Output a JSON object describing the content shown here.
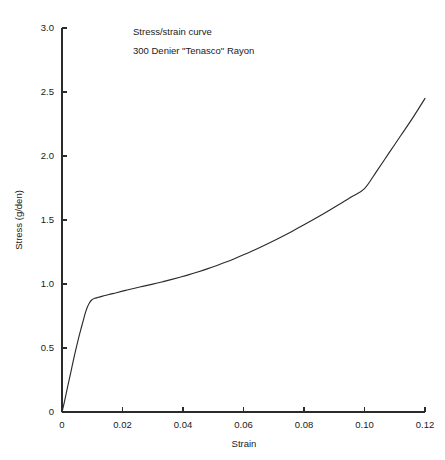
{
  "chart_data": {
    "type": "line",
    "title": "Stress/strain curve",
    "subtitle": "300 Denier \"Tenasco\" Rayon",
    "xlabel": "Strain",
    "ylabel": "Stress (g/den)",
    "xlim": [
      0,
      0.12
    ],
    "ylim": [
      0,
      3.0
    ],
    "grid": false,
    "legend": "none",
    "xticks": [
      0,
      0.02,
      0.04,
      0.06,
      0.08,
      0.1,
      0.12
    ],
    "xtick_labels": [
      "0",
      "0.02",
      "0.04",
      "0.06",
      "0.08",
      "0.10",
      "0.12"
    ],
    "yticks": [
      0,
      0.5,
      1.0,
      1.5,
      2.0,
      2.5,
      3.0
    ],
    "ytick_labels": [
      "0",
      "0.5",
      "1.0",
      "1.5",
      "2.0",
      "2.5",
      "3.0"
    ],
    "line_color": "#2b2b2b",
    "series": [
      {
        "name": "300 Denier \"Tenasco\" Rayon",
        "x": [
          0.0,
          0.0008,
          0.0018,
          0.003,
          0.0042,
          0.0054,
          0.0064,
          0.0072,
          0.0078,
          0.0084,
          0.009,
          0.0098,
          0.0108,
          0.012,
          0.0135,
          0.0155,
          0.018,
          0.021,
          0.024,
          0.027,
          0.03,
          0.033,
          0.036,
          0.039,
          0.042,
          0.045,
          0.048,
          0.051,
          0.054,
          0.057,
          0.06,
          0.064,
          0.068,
          0.072,
          0.076,
          0.08,
          0.084,
          0.088,
          0.092,
          0.096,
          0.1,
          0.104,
          0.108,
          0.112,
          0.116,
          0.12
        ],
        "y": [
          0.0,
          0.08,
          0.19,
          0.32,
          0.45,
          0.57,
          0.66,
          0.73,
          0.78,
          0.82,
          0.85,
          0.875,
          0.888,
          0.896,
          0.905,
          0.918,
          0.932,
          0.95,
          0.967,
          0.983,
          0.999,
          1.016,
          1.034,
          1.053,
          1.073,
          1.095,
          1.118,
          1.143,
          1.17,
          1.198,
          1.228,
          1.27,
          1.315,
          1.362,
          1.411,
          1.462,
          1.515,
          1.57,
          1.627,
          1.685,
          1.745,
          1.88,
          2.02,
          2.16,
          2.3,
          2.45
        ]
      }
    ]
  },
  "geometry": {
    "plot_left": 62,
    "plot_right": 425,
    "plot_top": 28,
    "plot_bottom": 412,
    "annotation_x": 133,
    "annotation_title_y": 35,
    "annotation_subtitle_y": 54,
    "xlabel_y": 447,
    "ylabel_x": 22,
    "ylabel_y": 220
  }
}
